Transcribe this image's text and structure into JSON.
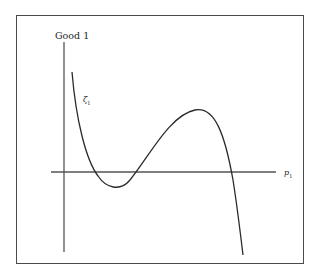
{
  "diagram": {
    "y_axis_label": "Good 1",
    "x_axis_label": "p",
    "x_axis_label_sub": "1",
    "curve_label": "ζ",
    "curve_label_sub": "1",
    "colors": {
      "line": "#2a2a2a",
      "axis": "#555555",
      "frame": "#4a4a4a"
    }
  }
}
